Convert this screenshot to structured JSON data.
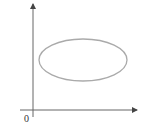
{
  "diagram": {
    "type": "coordinate-plane-with-ellipse",
    "origin_label": "0",
    "axes": {
      "color": "#555555",
      "x_axis": {
        "y": 110,
        "x_start": 20,
        "x_end": 138,
        "arrow": "right"
      },
      "y_axis": {
        "x": 33,
        "y_start": 117,
        "y_end": 3,
        "arrow": "up"
      }
    },
    "ellipse": {
      "cx": 83,
      "cy": 60,
      "rx": 44,
      "ry": 21,
      "stroke": "#aaaaaa"
    }
  }
}
